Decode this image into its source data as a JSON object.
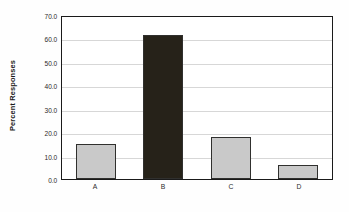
{
  "chart_data": {
    "type": "bar",
    "title": "",
    "subtitle": "",
    "xlabel": "",
    "ylabel": "Percent Responses",
    "categories": [
      "A",
      "B",
      "C",
      "D"
    ],
    "values": [
      15.0,
      61.5,
      18.0,
      6.0
    ],
    "series": [
      {
        "name": "Percent Responses",
        "values": [
          15.0,
          61.5,
          18.0,
          6.0
        ]
      }
    ],
    "ylim": [
      0.0,
      70.0
    ],
    "yticks": [
      0.0,
      10.0,
      20.0,
      30.0,
      40.0,
      50.0,
      60.0,
      70.0
    ],
    "ytick_labels": [
      "0.0",
      "10.0",
      "20.0",
      "30.0",
      "40.0",
      "50.0",
      "60.0",
      "70.0"
    ],
    "grid": true,
    "grid_axis": "y",
    "legend": false,
    "legend_position": "none",
    "bar_colors": [
      "#c9c9c9",
      "#262219",
      "#c9c9c9",
      "#c9c9c9"
    ],
    "bar_edge_color": "#30302e",
    "plot_border_color": "#1a1a1a",
    "gridline_color": "#d7d7d7",
    "background_color": "#ffffff",
    "annotations": []
  }
}
